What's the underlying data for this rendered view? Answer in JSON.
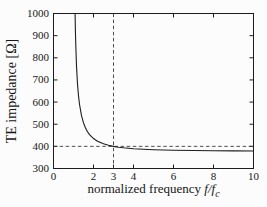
{
  "chart_data": {
    "type": "line",
    "title": "",
    "ylabel": "TE impedance [Ω]",
    "xlabel": {
      "main": "normalized frequency ",
      "math": "f/f",
      "sub": "c"
    },
    "xlim": [
      0,
      10
    ],
    "ylim": [
      300,
      1000
    ],
    "x_ticks_bottom": [
      0,
      2,
      3,
      4,
      6,
      8,
      10
    ],
    "x_tick_labels": [
      "0",
      "2",
      "3",
      "4",
      "6",
      "8",
      "10"
    ],
    "x_ticks_top": [
      2,
      4,
      6,
      8
    ],
    "y_ticks": [
      300,
      400,
      500,
      600,
      700,
      800,
      900,
      1000
    ],
    "y_tick_labels": [
      "300",
      "400",
      "500",
      "600",
      "700",
      "800",
      "900",
      "1000"
    ],
    "grid": false,
    "legend": "none",
    "reference_lines": {
      "vertical_x": 3,
      "horizontal_y": 400,
      "style": "dashed"
    },
    "series": [
      {
        "name": "TE impedance vs normalized frequency",
        "points": [
          [
            1.0797,
            1000
          ],
          [
            1.09,
            947.5
          ],
          [
            1.1,
            904.9
          ],
          [
            1.12,
            843.0
          ],
          [
            1.15,
            763.4
          ],
          [
            1.2,
            682.0
          ],
          [
            1.25,
            628.3
          ],
          [
            1.3,
            590.0
          ],
          [
            1.4,
            538.7
          ],
          [
            1.5,
            505.8
          ],
          [
            1.6,
            483.0
          ],
          [
            1.7,
            466.2
          ],
          [
            1.8,
            453.4
          ],
          [
            2.0,
            435.3
          ],
          [
            2.2,
            423.2
          ],
          [
            2.5,
            411.3
          ],
          [
            2.75,
            404.7
          ],
          [
            3.0,
            399.8
          ],
          [
            3.25,
            396.2
          ],
          [
            3.5,
            393.4
          ],
          [
            4.0,
            389.3
          ],
          [
            4.5,
            386.7
          ],
          [
            5.0,
            384.7
          ],
          [
            5.5,
            383.4
          ],
          [
            6.0,
            382.3
          ],
          [
            7.0,
            381.0
          ],
          [
            8.0,
            380.0
          ],
          [
            9.0,
            379.4
          ],
          [
            10.0,
            378.9
          ]
        ]
      }
    ],
    "colors": {
      "curve": "#1c1c1c",
      "frame": "#1c1c1c",
      "dashed": "#3a3a3a",
      "background": "#fcfcfc",
      "text": "#161616"
    }
  }
}
